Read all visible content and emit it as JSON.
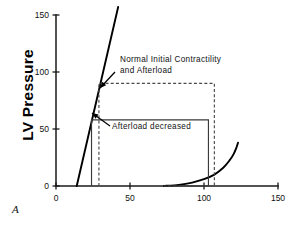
{
  "chart_data": {
    "type": "line",
    "title": "",
    "panel_label": "A",
    "xlabel": "",
    "ylabel": "LV Pressure",
    "xlim": [
      0,
      150
    ],
    "ylim": [
      0,
      150
    ],
    "xticks": [
      0,
      50,
      100,
      150
    ],
    "yticks": [
      0,
      50,
      100,
      150
    ],
    "xtick_labels": [
      "0",
      "50",
      "100",
      "150"
    ],
    "ytick_labels": [
      "0",
      "50",
      "100",
      "150"
    ],
    "grid": false,
    "legend": "none",
    "series": [
      {
        "name": "ESPVR (end-systolic pressure-volume relation)",
        "style": "solid",
        "color": "#000000",
        "x": [
          14,
          42
        ],
        "y": [
          0,
          157
        ]
      },
      {
        "name": "EDPVR (end-diastolic pressure-volume relation)",
        "style": "solid",
        "color": "#000000",
        "x": [
          73,
          83,
          92,
          100,
          107,
          113,
          117,
          120,
          122,
          123
        ],
        "y": [
          0,
          1,
          3,
          6,
          10,
          16,
          22,
          28,
          34,
          38
        ]
      },
      {
        "name": "Normal initial contractility and afterload loop",
        "style": "dashed",
        "color": "#4a4a4a",
        "x": [
          29,
          29,
          107,
          107,
          73
        ],
        "y": [
          0,
          90,
          90,
          0,
          0
        ]
      },
      {
        "name": "Afterload decreased loop",
        "style": "solid",
        "color": "#3a3a3a",
        "x": [
          24,
          24,
          103,
          103,
          73
        ],
        "y": [
          0,
          58,
          58,
          0,
          0
        ]
      }
    ],
    "annotations": [
      {
        "id": "normal-loop-annotation",
        "text_line_1": "Normal  Initial  Contractility",
        "text_line_2": "and  Afterload",
        "text_x": 120,
        "text_y": 62,
        "arrow_from_x": 115,
        "arrow_from_y": 72,
        "arrow_to_x": 100,
        "arrow_to_y": 88
      },
      {
        "id": "afterload-decreased-annotation",
        "text_line_1": "Afterload  decreased",
        "text_x": 112,
        "text_y": 129,
        "arrow_from_x": 110,
        "arrow_from_y": 126,
        "arrow_to_x": 92,
        "arrow_to_y": 113
      }
    ]
  },
  "geometry": {
    "plot_left_px": 56,
    "plot_bottom_px": 186,
    "plot_right_px": 278,
    "plot_top_px": 15
  }
}
